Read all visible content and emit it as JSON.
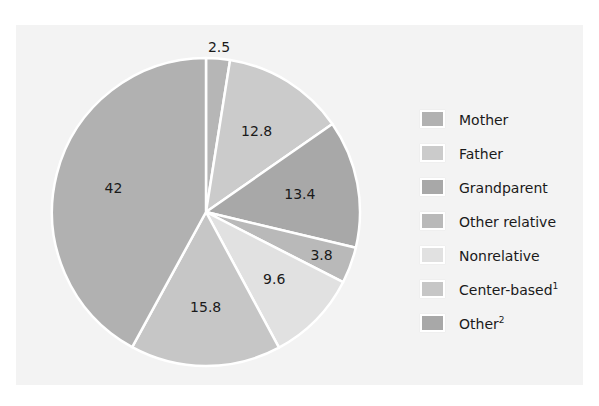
{
  "chart_data": {
    "type": "pie",
    "title": "",
    "start_angle_deg": 0,
    "direction": "clockwise",
    "slices": [
      {
        "label": "Other",
        "footnote": "2",
        "value": 2.5,
        "color": "#b6b6b6"
      },
      {
        "label": "Father",
        "footnote": "",
        "value": 12.8,
        "color": "#cbcbcb"
      },
      {
        "label": "Grandparent",
        "footnote": "",
        "value": 13.4,
        "color": "#a8a8a8"
      },
      {
        "label": "Other relative",
        "footnote": "",
        "value": 3.8,
        "color": "#b9b9b9"
      },
      {
        "label": "Nonrelative",
        "footnote": "",
        "value": 9.6,
        "color": "#e1e1e1"
      },
      {
        "label": "Center-based",
        "footnote": "1",
        "value": 15.8,
        "color": "#c6c6c6"
      },
      {
        "label": "Mother",
        "footnote": "",
        "value": 42,
        "color": "#b1b1b1"
      }
    ],
    "legend": {
      "position": "right",
      "entries": [
        {
          "label": "Mother",
          "footnote": "",
          "color": "#b1b1b1"
        },
        {
          "label": "Father",
          "footnote": "",
          "color": "#cbcbcb"
        },
        {
          "label": "Grandparent",
          "footnote": "",
          "color": "#a8a8a8"
        },
        {
          "label": "Other relative",
          "footnote": "",
          "color": "#b9b9b9"
        },
        {
          "label": "Nonrelative",
          "footnote": "",
          "color": "#e1e1e1"
        },
        {
          "label": "Center-based",
          "footnote": "1",
          "color": "#c6c6c6"
        },
        {
          "label": "Other",
          "footnote": "2",
          "color": "#a8a8a8"
        }
      ]
    },
    "data_labels": [
      "2.5",
      "12.8",
      "13.4",
      "3.8",
      "9.6",
      "15.8",
      "42"
    ]
  },
  "layout": {
    "center_x": 206,
    "center_y": 212,
    "radius": 154,
    "panel_color": "#f3f3f3"
  }
}
